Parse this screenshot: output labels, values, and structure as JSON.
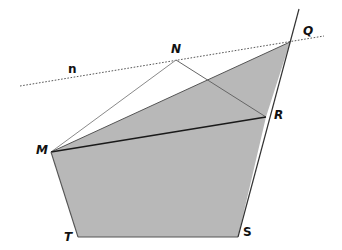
{
  "diagram": {
    "type": "geometry-figure",
    "points": {
      "N": {
        "label": "N"
      },
      "Q": {
        "label": "Q"
      },
      "R": {
        "label": "R"
      },
      "M": {
        "label": "M"
      },
      "T": {
        "label": "T"
      },
      "S": {
        "label": "S"
      }
    },
    "line_label": "n",
    "shaded_polygon": [
      "M",
      "Q",
      "R",
      "S",
      "T"
    ],
    "segments": [
      {
        "from": "M",
        "to": "N",
        "style": "thin"
      },
      {
        "from": "N",
        "to": "R",
        "style": "thin"
      },
      {
        "from": "M",
        "to": "R",
        "style": "bold"
      },
      {
        "from": "M",
        "to": "Q",
        "style": "normal"
      },
      {
        "from": "M",
        "to": "T",
        "style": "normal"
      },
      {
        "from": "T",
        "to": "S",
        "style": "normal"
      },
      {
        "from": "S",
        "to": "Q",
        "style": "normal",
        "extended_beyond": "Q"
      }
    ],
    "dotted_line": {
      "name": "n",
      "through": [
        "N",
        "Q"
      ]
    },
    "colors": {
      "fill": "#b8b8b8",
      "stroke": "#555555",
      "bold_stroke": "#1a1a1a",
      "thin_stroke": "#8a8a8a",
      "dotted": "#444444"
    }
  }
}
